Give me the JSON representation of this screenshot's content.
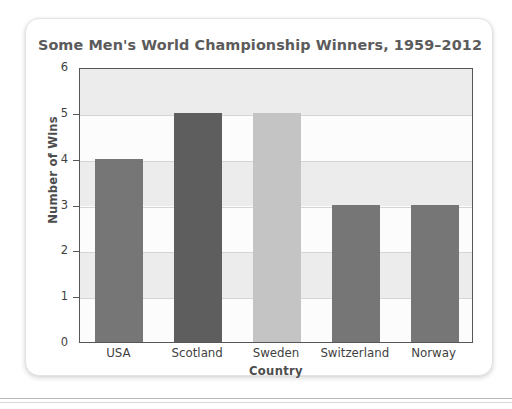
{
  "chart_data": {
    "type": "bar",
    "title": "Some Men's World Championship Winners, 1959–2012",
    "xlabel": "Country",
    "ylabel": "Number of Wins",
    "categories": [
      "USA",
      "Scotland",
      "Sweden",
      "Switzerland",
      "Norway"
    ],
    "values": [
      4,
      5,
      5,
      3,
      3
    ],
    "bar_colors": [
      "#767676",
      "#5e5e5e",
      "#c4c4c4",
      "#767676",
      "#767676"
    ],
    "ylim": [
      0,
      6
    ],
    "yticks": [
      0,
      1,
      2,
      3,
      4,
      5,
      6
    ],
    "ytick_labels": [
      "0",
      "1",
      "2",
      "3",
      "4",
      "5",
      "6"
    ],
    "grid": true,
    "grid_axis": "y",
    "legend": false,
    "legend_position": "none",
    "plot_background": "#fcfcfc",
    "band_color": "#ececec",
    "gridline_color": "#d5d5d5",
    "axis_color": "#55565a",
    "title_color": "#5b5b5b",
    "label_color": "#4d4d4d",
    "series": [
      {
        "name": "Wins",
        "values": [
          4,
          5,
          5,
          3,
          3
        ]
      }
    ],
    "points": [
      {
        "category": "USA",
        "value": 4,
        "color": "#767676"
      },
      {
        "category": "Scotland",
        "value": 5,
        "color": "#5e5e5e"
      },
      {
        "category": "Sweden",
        "value": 5,
        "color": "#c4c4c4"
      },
      {
        "category": "Switzerland",
        "value": 3,
        "color": "#767676"
      },
      {
        "category": "Norway",
        "value": 3,
        "color": "#767676"
      }
    ]
  },
  "card": {
    "background": "#ffffff",
    "border_color": "#e3e3e3"
  }
}
